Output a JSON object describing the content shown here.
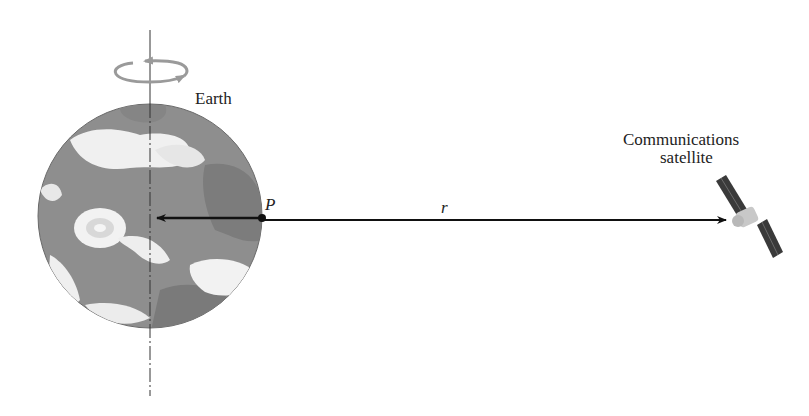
{
  "figure": {
    "earth_label": "Earth",
    "point_label": "P",
    "distance_label": "r",
    "satellite_label_line1": "Communications",
    "satellite_label_line2": "satellite"
  },
  "colors": {
    "earth_ocean": "#8e8e8e",
    "earth_land": "#7a7a7a",
    "clouds": "#f2f2f2",
    "arrow": "#111111",
    "rotation_arrow": "#9a9a9a",
    "solar_panel": "#3a3a3a",
    "satellite_body": "#c8c8c8"
  }
}
